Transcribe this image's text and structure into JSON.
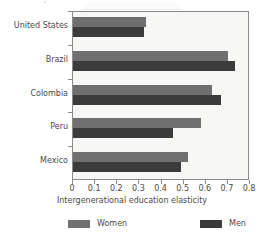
{
  "chart_data": {
    "type": "bar",
    "orientation": "horizontal",
    "title": "",
    "xlabel": "Intergenerational education elasticity",
    "ylabel": "",
    "xlim": [
      0,
      0.8
    ],
    "xticks": [
      "0",
      "0.1",
      "0.2",
      "0.3",
      "0.4",
      "0.5",
      "0.6",
      "0.7",
      "0.8"
    ],
    "xtick_values": [
      0,
      0.1,
      0.2,
      0.3,
      0.4,
      0.5,
      0.6,
      0.7,
      0.8
    ],
    "grid": false,
    "legend_position": "bottom",
    "categories": [
      "United States",
      "Brazil",
      "Colombia",
      "Peru",
      "Mexico"
    ],
    "series": [
      {
        "name": "Women",
        "color": "#6f6f6f",
        "values": [
          0.33,
          0.7,
          0.63,
          0.58,
          0.52
        ]
      },
      {
        "name": "Men",
        "color": "#3b3b3b",
        "values": [
          0.32,
          0.73,
          0.67,
          0.45,
          0.49
        ]
      }
    ]
  },
  "legend": {
    "items": [
      {
        "label": "Women",
        "color": "#6f6f6f"
      },
      {
        "label": "Men",
        "color": "#3b3b3b"
      }
    ]
  },
  "colors": {
    "women": "#6f6f6f",
    "men": "#3b3b3b",
    "axis": "#8a8a8a",
    "plot_background": "#f7f7f5",
    "text": "#4a4a4a"
  }
}
